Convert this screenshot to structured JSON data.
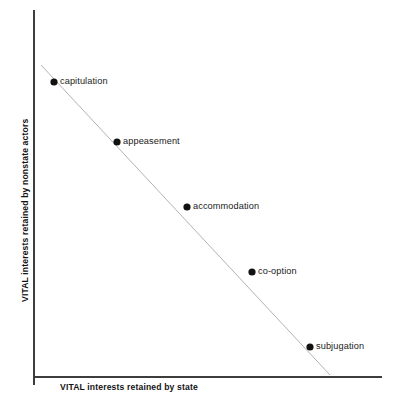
{
  "chart_data": {
    "type": "scatter",
    "title": "",
    "subtitle": "",
    "xlabel": "VITAL interests retained by state",
    "ylabel": "VITAL interests retained by nonstate actors",
    "grid": false,
    "legend": "none",
    "xlim": [
      0,
      10
    ],
    "ylim": [
      0,
      10
    ],
    "annotations": [],
    "categories": [
      "capitulation",
      "appeasement",
      "accommodation",
      "co-option",
      "subjugation"
    ],
    "series": [
      {
        "name": "outcome spectrum",
        "points": [
          {
            "label": "capitulation",
            "x": 0.7,
            "y": 9.2,
            "px": 54,
            "py": 82
          },
          {
            "label": "appeasement",
            "x": 2.4,
            "y": 7.5,
            "px": 117,
            "py": 142
          },
          {
            "label": "accommodation",
            "x": 4.4,
            "y": 5.7,
            "px": 187,
            "py": 207
          },
          {
            "label": "co-option",
            "x": 6.3,
            "y": 3.9,
            "px": 252,
            "py": 272
          },
          {
            "label": "subjugation",
            "x": 7.9,
            "y": 1.8,
            "px": 310,
            "py": 347
          }
        ]
      }
    ],
    "trendline": {
      "style": "solid",
      "color": "#b3b3b3",
      "x1": 41,
      "y1": 65,
      "x2": 330,
      "y2": 375
    },
    "colors": {
      "point": "#111111",
      "axis": "#3d3d3d",
      "trend": "#b3b3b3",
      "background": "#ffffff",
      "text": "#141414"
    },
    "axes": {
      "y_axis_x": 34,
      "y_axis_top": 10,
      "y_axis_bottom": 385,
      "x_axis_y": 377,
      "x_axis_left": 34,
      "x_axis_right": 382
    }
  }
}
